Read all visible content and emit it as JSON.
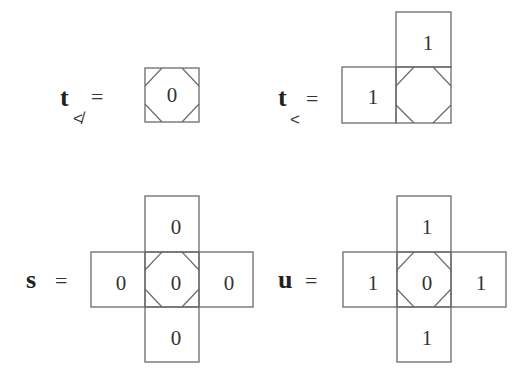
{
  "figures": [
    {
      "id": "t_not_less",
      "label": "t",
      "subscript": "≮",
      "equals": "=",
      "cells": [
        {
          "position": "center",
          "value": "0",
          "octagon": true
        }
      ]
    },
    {
      "id": "t_less",
      "label": "t",
      "subscript": "<",
      "equals": "=",
      "cells": [
        {
          "position": "top",
          "value": "1",
          "octagon": false
        },
        {
          "position": "left",
          "value": "1",
          "octagon": false
        },
        {
          "position": "center",
          "value": "",
          "octagon": true
        }
      ]
    },
    {
      "id": "s",
      "label": "s",
      "subscript": "",
      "equals": "=",
      "cells": [
        {
          "position": "top",
          "value": "0",
          "octagon": false
        },
        {
          "position": "left",
          "value": "0",
          "octagon": false
        },
        {
          "position": "center",
          "value": "0",
          "octagon": true
        },
        {
          "position": "right",
          "value": "0",
          "octagon": false
        },
        {
          "position": "bottom",
          "value": "0",
          "octagon": false
        }
      ]
    },
    {
      "id": "u",
      "label": "u",
      "subscript": "",
      "equals": "=",
      "cells": [
        {
          "position": "top",
          "value": "1",
          "octagon": false
        },
        {
          "position": "left",
          "value": "1",
          "octagon": false
        },
        {
          "position": "center",
          "value": "0",
          "octagon": true
        },
        {
          "position": "right",
          "value": "1",
          "octagon": false
        },
        {
          "position": "bottom",
          "value": "1",
          "octagon": false
        }
      ]
    }
  ]
}
